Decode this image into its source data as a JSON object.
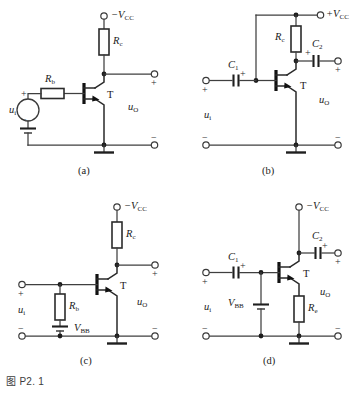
{
  "figure": {
    "caption": "图 P2. 1",
    "background_color": "#ffffff",
    "line_color": "#3f3f3f",
    "label_color": "#1a1a1a"
  },
  "circuits": [
    {
      "id": "a",
      "sub_caption": "(a)",
      "supply_label": "−V",
      "supply_sub": "CC",
      "transistor_label": "T",
      "transistor_type": "pnp",
      "input_label": "u",
      "input_sub": "i",
      "output_label": "u",
      "output_sub": "O",
      "components": [
        {
          "name": "collector-resistor",
          "label": "R",
          "sub": "c",
          "orientation": "vertical"
        },
        {
          "name": "base-resistor",
          "label": "R",
          "sub": "b",
          "orientation": "horizontal"
        },
        {
          "name": "input-source",
          "type": "ac-source",
          "plus": "+",
          "minus": "−"
        },
        {
          "name": "bias-battery",
          "type": "battery"
        }
      ],
      "terminal_signs": {
        "out_plus": "+",
        "out_minus": "−"
      }
    },
    {
      "id": "b",
      "sub_caption": "(b)",
      "supply_label": "+V",
      "supply_sub": "CC",
      "transistor_label": "T",
      "transistor_type": "pnp",
      "input_label": "u",
      "input_sub": "i",
      "output_label": "u",
      "output_sub": "O",
      "components": [
        {
          "name": "collector-resistor",
          "label": "R",
          "sub": "c",
          "orientation": "vertical"
        },
        {
          "name": "input-coupling-capacitor",
          "label": "C",
          "sub": "1",
          "polarity": "+",
          "polarity_side": "right"
        },
        {
          "name": "output-coupling-capacitor",
          "label": "C",
          "sub": "2",
          "polarity": "+",
          "polarity_side": "left"
        }
      ],
      "terminal_signs": {
        "in_plus": "+",
        "in_minus": "−",
        "out_plus": "+",
        "out_minus": "−"
      }
    },
    {
      "id": "c",
      "sub_caption": "(c)",
      "supply_label": "−V",
      "supply_sub": "CC",
      "transistor_label": "T",
      "transistor_type": "pnp",
      "input_label": "u",
      "input_sub": "i",
      "output_label": "u",
      "output_sub": "O",
      "components": [
        {
          "name": "collector-resistor",
          "label": "R",
          "sub": "c",
          "orientation": "vertical"
        },
        {
          "name": "base-resistor",
          "label": "R",
          "sub": "b",
          "orientation": "vertical"
        },
        {
          "name": "bias-battery",
          "label": "V",
          "sub": "BB",
          "type": "battery"
        }
      ],
      "terminal_signs": {
        "in_plus": "+",
        "in_minus": "−",
        "out_plus": "+",
        "out_minus": "−"
      }
    },
    {
      "id": "d",
      "sub_caption": "(d)",
      "supply_label": "−V",
      "supply_sub": "CC",
      "transistor_label": "T",
      "transistor_type": "pnp",
      "input_label": "u",
      "input_sub": "i",
      "output_label": "u",
      "output_sub": "O",
      "components": [
        {
          "name": "emitter-resistor",
          "label": "R",
          "sub": "e",
          "orientation": "vertical"
        },
        {
          "name": "input-coupling-capacitor",
          "label": "C",
          "sub": "1",
          "polarity": "+",
          "polarity_side": "right"
        },
        {
          "name": "output-coupling-capacitor",
          "label": "C",
          "sub": "2",
          "polarity": "+",
          "polarity_side": "right"
        },
        {
          "name": "bias-battery",
          "label": "V",
          "sub": "BB",
          "type": "battery"
        }
      ],
      "terminal_signs": {
        "in_plus": "+",
        "in_minus": "−",
        "out_plus": "+",
        "out_minus": "−"
      }
    }
  ]
}
